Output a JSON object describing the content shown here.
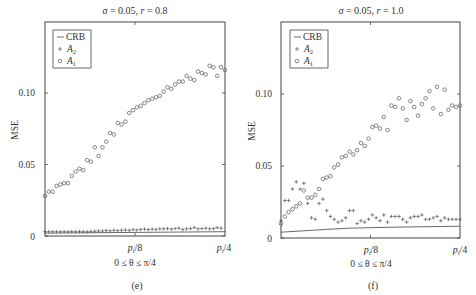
{
  "chart_data": [
    {
      "panel": "(e)",
      "type": "scatter",
      "title": "σ = 0.05, r = 0.8",
      "xlabel": "0 ≤ θ ≤ π/4",
      "ylabel": "MSE",
      "xticks": [
        "p_i/8",
        "p_i/4"
      ],
      "yticks": [
        "0",
        "0.05",
        "0.10"
      ],
      "ylim": [
        0,
        0.15
      ],
      "xlim": [
        0,
        0.7854
      ],
      "legend": [
        "CRB",
        "A2",
        "A1"
      ],
      "legend_position": "upper left",
      "frame": {
        "x0": 45,
        "x1": 225,
        "y0": 22,
        "y1": 236,
        "y_per_unit": 1430
      },
      "series": [
        {
          "name": "CRB",
          "marker": "line",
          "x": [
            0,
            0.7854
          ],
          "values": [
            0.002,
            0.003
          ]
        },
        {
          "name": "A2",
          "marker": "plus",
          "x": [
            0,
            0.0167,
            0.0334,
            0.0501,
            0.0668,
            0.0835,
            0.1002,
            0.1169,
            0.1336,
            0.1503,
            0.167,
            0.1837,
            0.2004,
            0.2171,
            0.2338,
            0.2505,
            0.2672,
            0.2839,
            0.3006,
            0.3173,
            0.334,
            0.3507,
            0.3674,
            0.3841,
            0.4008,
            0.4175,
            0.4342,
            0.4509,
            0.4676,
            0.4843,
            0.501,
            0.5177,
            0.5344,
            0.5511,
            0.5678,
            0.5845,
            0.6012,
            0.6179,
            0.6346,
            0.6513,
            0.668,
            0.6847,
            0.7014,
            0.7181,
            0.7348,
            0.7515,
            0.7682
          ],
          "values": [
            0.003,
            0.003,
            0.003,
            0.003,
            0.003,
            0.003,
            0.003,
            0.0032,
            0.003,
            0.0032,
            0.003,
            0.003,
            0.0032,
            0.0033,
            0.0035,
            0.0035,
            0.0038,
            0.0036,
            0.004,
            0.0038,
            0.004,
            0.0042,
            0.004,
            0.0045,
            0.0042,
            0.0045,
            0.0048,
            0.0045,
            0.0048,
            0.0046,
            0.005,
            0.005,
            0.0052,
            0.0048,
            0.0052,
            0.0055,
            0.0045,
            0.005,
            0.0052,
            0.0058,
            0.005,
            0.0052,
            0.0055,
            0.005,
            0.0052,
            0.0058,
            0.0055
          ]
        },
        {
          "name": "A1",
          "marker": "circle",
          "x": [
            0,
            0.0167,
            0.0334,
            0.0501,
            0.0668,
            0.0835,
            0.1002,
            0.1169,
            0.1336,
            0.1503,
            0.167,
            0.1837,
            0.2004,
            0.2171,
            0.2338,
            0.2505,
            0.2672,
            0.2839,
            0.3006,
            0.3173,
            0.334,
            0.3507,
            0.3674,
            0.3841,
            0.4008,
            0.4175,
            0.4342,
            0.4509,
            0.4676,
            0.4843,
            0.501,
            0.5177,
            0.5344,
            0.5511,
            0.5678,
            0.5845,
            0.6012,
            0.6179,
            0.6346,
            0.6513,
            0.668,
            0.6847,
            0.7014,
            0.7181,
            0.7348,
            0.7515,
            0.7682,
            0.785
          ],
          "values": [
            0.028,
            0.031,
            0.031,
            0.035,
            0.036,
            0.037,
            0.037,
            0.042,
            0.045,
            0.047,
            0.046,
            0.053,
            0.052,
            0.062,
            0.056,
            0.062,
            0.066,
            0.072,
            0.071,
            0.079,
            0.078,
            0.08,
            0.086,
            0.088,
            0.09,
            0.091,
            0.093,
            0.095,
            0.096,
            0.097,
            0.098,
            0.101,
            0.104,
            0.103,
            0.106,
            0.108,
            0.108,
            0.112,
            0.11,
            0.109,
            0.115,
            0.114,
            0.113,
            0.119,
            0.118,
            0.112,
            0.118,
            0.116
          ]
        }
      ]
    },
    {
      "panel": "(f)",
      "type": "scatter",
      "title": "σ = 0.05, r = 1.0",
      "xlabel": "0 ≤ θ ≤ π/4",
      "ylabel": "MSE",
      "xticks": [
        "p_i/8",
        "p_i/4"
      ],
      "yticks": [
        "0",
        "0.05",
        "0.10"
      ],
      "ylim": [
        0,
        0.15
      ],
      "xlim": [
        0,
        0.7854
      ],
      "legend": [
        "CRB",
        "A2",
        "A1"
      ],
      "legend_position": "upper left",
      "frame": {
        "x0": 281,
        "x1": 460,
        "y0": 22,
        "y1": 238,
        "y_per_unit": 1440
      },
      "series": [
        {
          "name": "CRB",
          "marker": "line",
          "x": [
            0,
            0.1,
            0.2,
            0.3,
            0.4,
            0.5,
            0.6,
            0.7,
            0.7854
          ],
          "values": [
            0.004,
            0.005,
            0.006,
            0.0068,
            0.0072,
            0.0075,
            0.0078,
            0.008,
            0.0082
          ]
        },
        {
          "name": "A2",
          "marker": "plus",
          "x": [
            0,
            0.0167,
            0.0334,
            0.0501,
            0.0668,
            0.0835,
            0.1002,
            0.1169,
            0.1336,
            0.1503,
            0.167,
            0.1837,
            0.2004,
            0.2171,
            0.2338,
            0.2505,
            0.2672,
            0.2839,
            0.3006,
            0.3173,
            0.334,
            0.3507,
            0.3674,
            0.3841,
            0.4008,
            0.4175,
            0.4342,
            0.4509,
            0.4676,
            0.4843,
            0.501,
            0.5177,
            0.5344,
            0.5511,
            0.5678,
            0.5845,
            0.6012,
            0.6179,
            0.6346,
            0.6513,
            0.668,
            0.6847,
            0.7014,
            0.7181,
            0.7348,
            0.7515,
            0.7682,
            0.785
          ],
          "values": [
            0.012,
            0.026,
            0.026,
            0.034,
            0.039,
            0.034,
            0.038,
            0.024,
            0.014,
            0.013,
            0.024,
            0.027,
            0.019,
            0.015,
            0.013,
            0.011,
            0.012,
            0.014,
            0.019,
            0.019,
            0.01,
            0.012,
            0.011,
            0.013,
            0.016,
            0.014,
            0.012,
            0.016,
            0.011,
            0.015,
            0.015,
            0.015,
            0.013,
            0.011,
            0.014,
            0.015,
            0.015,
            0.016,
            0.013,
            0.013,
            0.014,
            0.015,
            0.012,
            0.014,
            0.013,
            0.013,
            0.013,
            0.013
          ]
        },
        {
          "name": "A1",
          "marker": "circle",
          "x": [
            0,
            0.0167,
            0.0334,
            0.0501,
            0.0668,
            0.0835,
            0.1002,
            0.1169,
            0.1336,
            0.1503,
            0.167,
            0.1837,
            0.2004,
            0.2171,
            0.2338,
            0.2505,
            0.2672,
            0.2839,
            0.3006,
            0.3173,
            0.334,
            0.3507,
            0.3674,
            0.3841,
            0.4008,
            0.4175,
            0.4342,
            0.4509,
            0.4676,
            0.4843,
            0.501,
            0.5177,
            0.5344,
            0.5511,
            0.5678,
            0.5845,
            0.6012,
            0.6179,
            0.6346,
            0.6513,
            0.668,
            0.6847,
            0.7014,
            0.7181,
            0.7348,
            0.7515,
            0.7682,
            0.785
          ],
          "values": [
            0.01,
            0.015,
            0.018,
            0.02,
            0.022,
            0.024,
            0.033,
            0.028,
            0.028,
            0.03,
            0.034,
            0.041,
            0.042,
            0.043,
            0.049,
            0.051,
            0.056,
            0.057,
            0.06,
            0.058,
            0.061,
            0.066,
            0.064,
            0.069,
            0.077,
            0.078,
            0.076,
            0.084,
            0.075,
            0.092,
            0.091,
            0.097,
            0.09,
            0.082,
            0.095,
            0.091,
            0.085,
            0.093,
            0.097,
            0.102,
            0.09,
            0.105,
            0.086,
            0.103,
            0.089,
            0.092,
            0.091,
            0.092
          ]
        }
      ]
    }
  ],
  "panels": [
    {
      "title_sigma": "σ",
      "title_rest": " = 0.05, ",
      "title_r": "r",
      "title_rval": " = 0.8",
      "caption": "(e)"
    },
    {
      "title_sigma": "σ",
      "title_rest": " = 0.05, ",
      "title_r": "r",
      "title_rval": " = 1.0",
      "caption": "(f)"
    }
  ],
  "axes": {
    "ylabel": "MSE",
    "ytick_0": "0",
    "ytick_005": "0.05",
    "ytick_010": "0.10",
    "xtick_mid_p": "p",
    "xtick_mid_sub": "i",
    "xtick_mid_rest": "/8",
    "xtick_end_p": "p",
    "xtick_end_sub": "i",
    "xtick_end_rest": "/4",
    "xlabel": "0 ≤ θ ≤ π/4"
  },
  "legend": {
    "crb": "CRB",
    "a2_main": "A",
    "a2_sub": "2",
    "a1_main": "A",
    "a1_sub": "1"
  },
  "colors": {
    "axis": "#444444",
    "marker": "#555555",
    "text": "#333333"
  }
}
